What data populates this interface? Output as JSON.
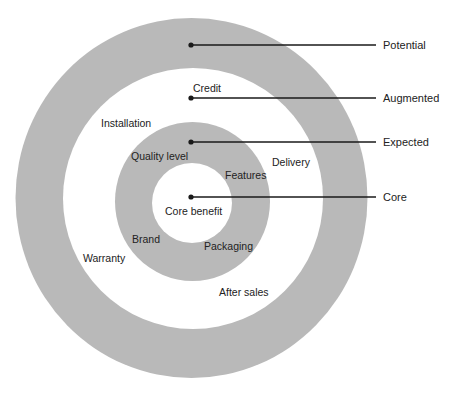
{
  "diagram": {
    "type": "concentric-rings",
    "colors": {
      "ring": "#b9b9b9",
      "background": "#ffffff",
      "line": "#1a1a1a",
      "text": "#222222"
    },
    "levels": [
      {
        "name": "Potential",
        "y": 45
      },
      {
        "name": "Augmented",
        "y": 98
      },
      {
        "name": "Expected",
        "y": 142
      },
      {
        "name": "Core",
        "y": 197
      }
    ],
    "items": {
      "core_benefit": "Core benefit",
      "credit": "Credit",
      "installation": "Installation",
      "quality_level": "Quality level",
      "features": "Features",
      "delivery": "Delivery",
      "brand": "Brand",
      "packaging": "Packaging",
      "warranty": "Warranty",
      "after_sales": "After sales"
    }
  }
}
